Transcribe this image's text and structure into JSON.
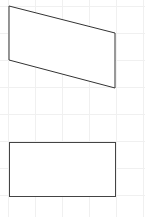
{
  "canvas": {
    "width": 145,
    "height": 217,
    "background": "#ffffff",
    "grid": {
      "visible": true,
      "spacing": 27,
      "color": "#f0f0f0"
    }
  },
  "shapes": [
    {
      "type": "parallelogram",
      "points": "9,6 115,33 115,88 9,60",
      "stroke": "#333333",
      "fill": "#ffffff",
      "stroke_width": 1
    },
    {
      "type": "rectangle",
      "x": 9,
      "y": 142,
      "width": 106,
      "height": 54,
      "stroke": "#444444",
      "fill": "#ffffff",
      "stroke_width": 1
    }
  ]
}
